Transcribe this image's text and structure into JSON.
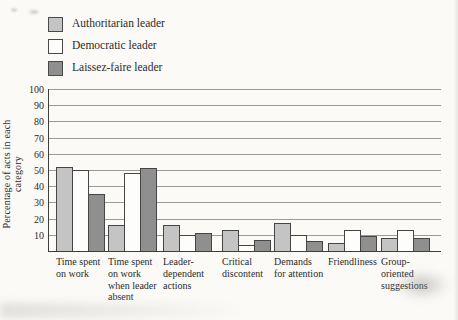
{
  "legend": {
    "items": [
      {
        "label": "Authoritarian leader",
        "color": "#c4c4c4"
      },
      {
        "label": "Democratic leader",
        "color": "#fdfdfc"
      },
      {
        "label": "Laissez-faire leader",
        "color": "#8f8f8f"
      }
    ]
  },
  "chart_data": {
    "type": "bar",
    "title": "",
    "xlabel": "",
    "ylabel": "Percentage of acts in each category",
    "ylim": [
      0,
      100
    ],
    "yticks": [
      10,
      20,
      30,
      40,
      50,
      60,
      70,
      80,
      90,
      100
    ],
    "grid": true,
    "legend_position": "top-left",
    "categories": [
      "Time spent on work",
      "Time spent on work when leader absent",
      "Leader-dependent actions",
      "Critical discontent",
      "Demands for attention",
      "Friendliness",
      "Group-oriented suggestions"
    ],
    "series": [
      {
        "name": "Authoritarian leader",
        "color": "#c4c4c4",
        "values": [
          52,
          16,
          16,
          13,
          17,
          5,
          8
        ]
      },
      {
        "name": "Democratic leader",
        "color": "#fdfdfc",
        "values": [
          50,
          48,
          10,
          4,
          10,
          13,
          13
        ]
      },
      {
        "name": "Laissez-faire leader",
        "color": "#8f8f8f",
        "values": [
          35,
          51,
          11,
          7,
          6,
          9,
          8
        ]
      }
    ],
    "colors": {
      "axis": "#3e3e3e",
      "gridline": "#9a9a98",
      "bar_border": "#454545"
    }
  }
}
